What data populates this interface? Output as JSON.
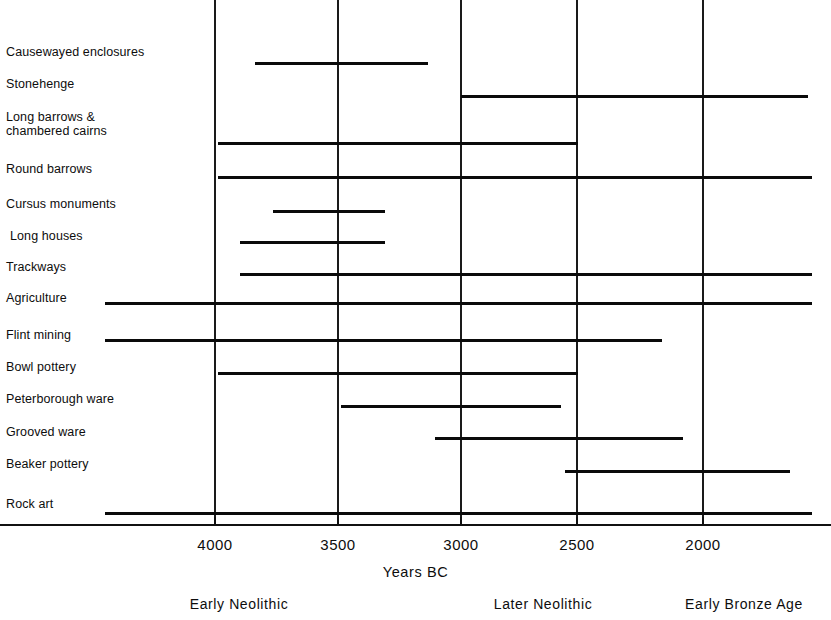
{
  "chart_data": {
    "type": "bar",
    "orientation": "horizontal-timeline",
    "title": "",
    "xlabel": "Years BC",
    "ylabel": "",
    "xlim": [
      4250,
      1680
    ],
    "x_direction": "decreasing",
    "grid": true,
    "gridlines_at": [
      4000,
      3500,
      3000,
      2500,
      2000
    ],
    "xticks": [
      4000,
      3500,
      3000,
      2500,
      2000
    ],
    "xticklabels": [
      "4000",
      "3500",
      "3000",
      "2500",
      "2000"
    ],
    "legend": null,
    "categories": [
      "Causewayed enclosures",
      "Stonehenge",
      "Long barrows &\nchambered cairns",
      "Round barrows",
      "Cursus monuments",
      "Long houses",
      "Trackways",
      "Agriculture",
      "Flint mining",
      "Bowl pottery",
      "Peterborough ware",
      "Grooved ware",
      "Beaker pottery",
      "Rock art"
    ],
    "bars": [
      {
        "label": "Causewayed enclosures",
        "start": 3840,
        "end": 3130
      },
      {
        "label": "Stonehenge",
        "start": 3000,
        "end": 1750
      },
      {
        "label": "Long barrows & chambered cairns",
        "start": 3990,
        "end": 2520
      },
      {
        "label": "Round barrows",
        "start": 4060,
        "end": 1750
      },
      {
        "label": "Cursus monuments",
        "start": 3800,
        "end": 3340
      },
      {
        "label": "Long houses",
        "start": 3930,
        "end": 3340
      },
      {
        "label": "Trackways",
        "start": 3930,
        "end": 1750
      },
      {
        "label": "Agriculture",
        "start": 4460,
        "end": 1750
      },
      {
        "label": "Flint mining",
        "start": 4460,
        "end": 2170
      },
      {
        "label": "Bowl pottery",
        "start": 4060,
        "end": 2520
      },
      {
        "label": "Peterborough ware",
        "start": 3500,
        "end": 2420
      },
      {
        "label": "Grooved ware",
        "start": 3100,
        "end": 2090
      },
      {
        "label": "Beaker pottery",
        "start": 2570,
        "end": 1790
      },
      {
        "label": "Rock art",
        "start": 4460,
        "end": 1750
      }
    ],
    "annotations": [
      {
        "text": "Early Neolithic",
        "at_year": 3810
      },
      {
        "text": "Later Neolithic",
        "at_year": 2830
      },
      {
        "text": "Early Bronze Age",
        "at_year": 2100
      }
    ]
  },
  "rows": [
    {
      "label": "Causewayed enclosures",
      "label_top": 45,
      "indent": false,
      "bar_top": 62,
      "bar_left": 255,
      "bar_right": 428
    },
    {
      "label": "Stonehenge",
      "label_top": 77,
      "indent": false,
      "bar_top": 95,
      "bar_left": 461,
      "bar_right": 808
    },
    {
      "label": "Long barrows &\nchambered cairns",
      "label_top": 110,
      "indent": false,
      "bar_top": 142,
      "bar_left": 218,
      "bar_right": 578
    },
    {
      "label": "Round barrows",
      "label_top": 162,
      "indent": false,
      "bar_top": 176,
      "bar_left": 218,
      "bar_right": 812
    },
    {
      "label": "Cursus monuments",
      "label_top": 197,
      "indent": false,
      "bar_top": 210,
      "bar_left": 273,
      "bar_right": 385
    },
    {
      "label": "Long houses",
      "label_top": 229,
      "indent": true,
      "bar_top": 241,
      "bar_left": 240,
      "bar_right": 385
    },
    {
      "label": "Trackways",
      "label_top": 260,
      "indent": false,
      "bar_top": 273,
      "bar_left": 240,
      "bar_right": 812
    },
    {
      "label": "Agriculture",
      "label_top": 291,
      "indent": false,
      "bar_top": 302,
      "bar_left": 105,
      "bar_right": 812
    },
    {
      "label": "Flint mining",
      "label_top": 328,
      "indent": false,
      "bar_top": 339,
      "bar_left": 105,
      "bar_right": 662
    },
    {
      "label": "Bowl pottery",
      "label_top": 360,
      "indent": false,
      "bar_top": 372,
      "bar_left": 218,
      "bar_right": 578
    },
    {
      "label": "Peterborough ware",
      "label_top": 392,
      "indent": false,
      "bar_top": 405,
      "bar_left": 341,
      "bar_right": 561
    },
    {
      "label": "Grooved ware",
      "label_top": 425,
      "indent": false,
      "bar_top": 437,
      "bar_left": 435,
      "bar_right": 683
    },
    {
      "label": "Beaker pottery",
      "label_top": 457,
      "indent": false,
      "bar_top": 470,
      "bar_left": 565,
      "bar_right": 790
    },
    {
      "label": "Rock art",
      "label_top": 497,
      "indent": false,
      "bar_top": 512,
      "bar_left": 105,
      "bar_right": 812
    }
  ],
  "axis": {
    "title": "Years BC",
    "line_top": 524,
    "ticks": [
      {
        "label": "4000",
        "x": 215
      },
      {
        "label": "3500",
        "x": 338
      },
      {
        "label": "3000",
        "x": 461
      },
      {
        "label": "2500",
        "x": 577
      },
      {
        "label": "2000",
        "x": 703
      }
    ],
    "gridlines_x": [
      215,
      338,
      461,
      577,
      703
    ]
  },
  "periods": [
    {
      "label": "Early Neolithic",
      "x": 239
    },
    {
      "label": "Later Neolithic",
      "x": 543
    },
    {
      "label": "Early Bronze Age",
      "x": 744
    }
  ]
}
